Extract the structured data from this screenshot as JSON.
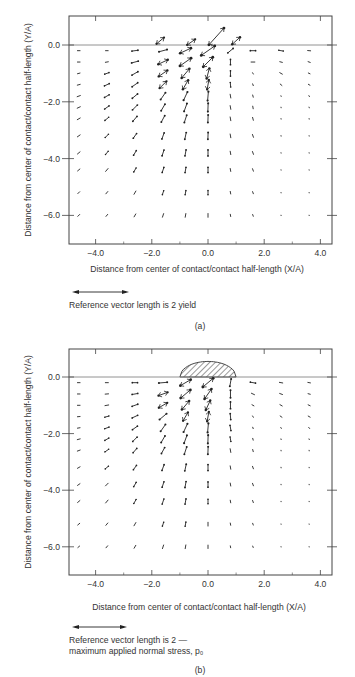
{
  "figure": {
    "panels": [
      {
        "id": "a",
        "caption": "(a)",
        "reference_text_lines": [
          "Reference vector length is 2 yield"
        ],
        "contact_shape": false
      },
      {
        "id": "b",
        "caption": "(b)",
        "reference_text_lines": [
          "Reference vector length is 2 —",
          "maximum applied normal stress, p₀"
        ],
        "contact_shape": true
      }
    ]
  },
  "chart_data": [
    {
      "type": "vector-field",
      "panel": "a",
      "title": "",
      "xlabel": "Distance from center of contact/contact half-length (X/A)",
      "ylabel": "Distance from center of contact/contact half-length (Y/A)",
      "xlim": [
        -5.0,
        4.4
      ],
      "ylim": [
        -7.0,
        1.0
      ],
      "xticks": [
        -4.0,
        -2.0,
        0.0,
        2.0,
        4.0
      ],
      "xtick_labels": [
        "-4.0",
        "-2.0",
        "0.0",
        "2.0",
        "4.0"
      ],
      "yticks": [
        0.0,
        -2.0,
        -4.0,
        -6.0
      ],
      "ytick_labels": [
        "0.0",
        "-2.0",
        "-4.0",
        "-6.0"
      ],
      "grid": false,
      "surface_line_y": 0.0,
      "reference_vector": {
        "length": 2,
        "units": "yield",
        "label": "Reference vector length is 2 yield"
      },
      "x": [
        -4.6,
        -3.6,
        -2.6,
        -1.6,
        -0.8,
        0.0,
        0.8,
        1.6,
        2.6,
        3.6
      ],
      "y": [
        -0.2,
        -0.6,
        -1.0,
        -1.4,
        -1.8,
        -2.2,
        -2.6,
        -3.2,
        -3.8,
        -4.4,
        -5.2,
        -6.0
      ],
      "angles_deg": [
        [
          0,
          0,
          8,
          15,
          25,
          35,
          40,
          0,
          -10,
          -5
        ],
        [
          0,
          10,
          15,
          25,
          35,
          45,
          90,
          0,
          -15,
          -20
        ],
        [
          15,
          20,
          30,
          35,
          50,
          75,
          90,
          -60,
          -30,
          -25
        ],
        [
          15,
          25,
          35,
          45,
          60,
          80,
          95,
          -70,
          -40,
          -30
        ],
        [
          20,
          30,
          40,
          55,
          65,
          85,
          100,
          -75,
          -70,
          -60
        ],
        [
          25,
          35,
          45,
          60,
          70,
          88,
          100,
          -80,
          -80,
          -70
        ],
        [
          30,
          40,
          50,
          62,
          72,
          88,
          100,
          -75,
          -80,
          -80
        ],
        [
          35,
          45,
          55,
          70,
          78,
          88,
          100,
          -70,
          -80,
          -80
        ],
        [
          40,
          50,
          60,
          72,
          80,
          90,
          100,
          -70,
          -80,
          -80
        ],
        [
          40,
          50,
          60,
          72,
          80,
          90,
          100,
          -70,
          -80,
          -80
        ],
        [
          45,
          50,
          60,
          72,
          80,
          90,
          100,
          -70,
          -80,
          -80
        ],
        [
          45,
          50,
          60,
          72,
          80,
          90,
          100,
          -70,
          -80,
          -80
        ]
      ],
      "lengths": [
        [
          0.35,
          0.35,
          0.8,
          1.1,
          1.6,
          2.2,
          0.9,
          0.7,
          0.6,
          0.4
        ],
        [
          0.35,
          0.4,
          0.9,
          1.4,
          1.8,
          1.8,
          0.7,
          0.5,
          0.35,
          0.3
        ],
        [
          0.35,
          0.6,
          0.9,
          1.4,
          1.6,
          1.4,
          0.7,
          0.2,
          0.4,
          0.25
        ],
        [
          0.4,
          0.7,
          0.9,
          1.3,
          1.4,
          1.3,
          0.6,
          0.25,
          0.3,
          0.25
        ],
        [
          0.45,
          0.7,
          0.9,
          1.1,
          1.2,
          1.2,
          0.5,
          0.3,
          0.1,
          0.15
        ],
        [
          0.45,
          0.7,
          0.9,
          1.0,
          1.1,
          1.1,
          0.5,
          0.35,
          0.08,
          0.1
        ],
        [
          0.45,
          0.65,
          0.85,
          0.95,
          1.0,
          1.0,
          0.5,
          0.4,
          0.08,
          0.08
        ],
        [
          0.45,
          0.6,
          0.75,
          0.85,
          0.9,
          0.9,
          0.5,
          0.4,
          0.08,
          0.06
        ],
        [
          0.45,
          0.55,
          0.7,
          0.8,
          0.8,
          0.8,
          0.45,
          0.4,
          0.06,
          0.06
        ],
        [
          0.4,
          0.5,
          0.6,
          0.7,
          0.7,
          0.7,
          0.4,
          0.35,
          0.05,
          0.05
        ],
        [
          0.35,
          0.4,
          0.5,
          0.55,
          0.55,
          0.55,
          0.35,
          0.3,
          0.05,
          0.05
        ],
        [
          0.35,
          0.35,
          0.45,
          0.5,
          0.5,
          0.5,
          0.3,
          0.25,
          0.05,
          0.05
        ]
      ],
      "surface_vectors": [
        {
          "x": -1.7,
          "y": 0.15,
          "angle_deg": 40,
          "length": 1.3
        },
        {
          "x": -0.6,
          "y": 0.1,
          "angle_deg": 35,
          "length": 1.3
        },
        {
          "x": 0.3,
          "y": 0.3,
          "angle_deg": 48,
          "length": 3.0
        },
        {
          "x": 1.0,
          "y": 0.15,
          "angle_deg": 42,
          "length": 1.4
        }
      ]
    },
    {
      "type": "vector-field",
      "panel": "b",
      "title": "",
      "xlabel": "Distance from center of contact/contact half-length (X/A)",
      "ylabel": "Distance from center of contact/contact half-length (Y/A)",
      "xlim": [
        -5.0,
        4.4
      ],
      "ylim": [
        -7.0,
        1.0
      ],
      "xticks": [
        -4.0,
        -2.0,
        0.0,
        2.0,
        4.0
      ],
      "xtick_labels": [
        "-4.0",
        "-2.0",
        "0.0",
        "2.0",
        "4.0"
      ],
      "yticks": [
        0.0,
        -2.0,
        -4.0,
        -6.0
      ],
      "ytick_labels": [
        "0.0",
        "-2.0",
        "-4.0",
        "-6.0"
      ],
      "grid": false,
      "surface_line_y": 0.0,
      "contact_pressure_region": {
        "x_from": -1.0,
        "x_to": 1.0,
        "peak": 0.55,
        "hatched": true
      },
      "reference_vector": {
        "length": 2,
        "units": "maximum applied normal stress, p0",
        "label": "Reference vector length is 2 — maximum applied normal stress, p0"
      },
      "x": [
        -4.6,
        -3.6,
        -2.6,
        -1.6,
        -0.8,
        0.0,
        0.8,
        1.6,
        2.6,
        3.6
      ],
      "y": [
        -0.2,
        -0.6,
        -1.0,
        -1.4,
        -1.8,
        -2.2,
        -2.6,
        -3.2,
        -3.8,
        -4.4,
        -5.2,
        -6.0
      ],
      "angles_deg": [
        [
          0,
          0,
          0,
          5,
          30,
          40,
          80,
          -10,
          -10,
          -10
        ],
        [
          0,
          5,
          10,
          20,
          40,
          55,
          90,
          -25,
          -20,
          -15
        ],
        [
          0,
          10,
          20,
          30,
          50,
          65,
          90,
          -30,
          -30,
          -25
        ],
        [
          5,
          15,
          25,
          40,
          60,
          80,
          95,
          -60,
          -35,
          -30
        ],
        [
          10,
          20,
          35,
          55,
          65,
          85,
          100,
          -70,
          -60,
          -50
        ],
        [
          15,
          30,
          45,
          60,
          70,
          88,
          100,
          -75,
          -75,
          -70
        ],
        [
          20,
          35,
          50,
          62,
          72,
          88,
          100,
          -75,
          -80,
          -80
        ],
        [
          30,
          40,
          55,
          70,
          78,
          90,
          100,
          -70,
          -80,
          -80
        ],
        [
          35,
          45,
          60,
          72,
          80,
          90,
          100,
          -70,
          -80,
          -80
        ],
        [
          40,
          50,
          60,
          72,
          80,
          90,
          100,
          -70,
          -80,
          -80
        ],
        [
          40,
          50,
          60,
          72,
          80,
          90,
          100,
          -70,
          -80,
          -80
        ],
        [
          40,
          50,
          60,
          72,
          80,
          90,
          100,
          -70,
          -80,
          -80
        ]
      ],
      "lengths": [
        [
          0.35,
          0.4,
          0.7,
          1.1,
          1.6,
          1.8,
          1.0,
          0.7,
          0.45,
          0.35
        ],
        [
          0.35,
          0.45,
          0.75,
          1.3,
          1.7,
          1.6,
          1.0,
          0.45,
          0.4,
          0.3
        ],
        [
          0.35,
          0.5,
          0.8,
          1.3,
          1.5,
          1.4,
          0.9,
          0.3,
          0.35,
          0.3
        ],
        [
          0.35,
          0.55,
          0.8,
          1.2,
          1.3,
          1.3,
          0.8,
          0.2,
          0.3,
          0.3
        ],
        [
          0.35,
          0.6,
          0.8,
          1.1,
          1.2,
          1.2,
          0.7,
          0.2,
          0.15,
          0.2
        ],
        [
          0.4,
          0.6,
          0.8,
          1.0,
          1.1,
          1.1,
          0.6,
          0.25,
          0.1,
          0.1
        ],
        [
          0.4,
          0.6,
          0.75,
          0.9,
          1.0,
          1.0,
          0.5,
          0.3,
          0.08,
          0.08
        ],
        [
          0.4,
          0.55,
          0.7,
          0.8,
          0.9,
          0.8,
          0.45,
          0.35,
          0.08,
          0.06
        ],
        [
          0.4,
          0.5,
          0.65,
          0.75,
          0.8,
          0.7,
          0.4,
          0.35,
          0.06,
          0.06
        ],
        [
          0.4,
          0.5,
          0.6,
          0.7,
          0.7,
          0.6,
          0.35,
          0.3,
          0.05,
          0.05
        ],
        [
          0.35,
          0.4,
          0.5,
          0.55,
          0.55,
          0.5,
          0.3,
          0.25,
          0.05,
          0.05
        ],
        [
          0.3,
          0.35,
          0.45,
          0.5,
          0.5,
          0.45,
          0.25,
          0.2,
          0.05,
          0.05
        ]
      ],
      "surface_vectors": []
    }
  ]
}
